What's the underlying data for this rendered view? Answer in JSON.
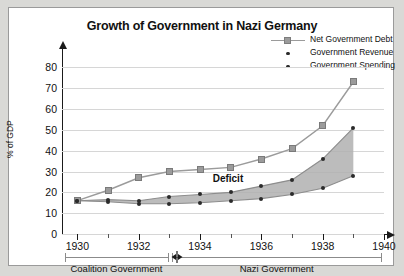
{
  "chart_data": {
    "type": "line",
    "title": "Growth of Government in Nazi Germany",
    "xlabel": "",
    "ylabel": "% of GDP",
    "xlim": [
      1929.5,
      1940
    ],
    "ylim": [
      0,
      85
    ],
    "yticks": [
      0,
      10,
      20,
      30,
      40,
      50,
      60,
      70,
      80
    ],
    "xticks": [
      1930,
      1932,
      1934,
      1936,
      1938,
      1940
    ],
    "x": [
      1930,
      1931,
      1932,
      1933,
      1934,
      1935,
      1936,
      1937,
      1938,
      1939
    ],
    "grid": true,
    "legend_position": "top-right",
    "series": [
      {
        "name": "Net Government Debt",
        "marker": "square",
        "color": "#9b9b9b",
        "values": [
          16,
          21,
          27,
          30,
          31,
          32,
          36,
          41,
          52,
          73
        ]
      },
      {
        "name": "Government Spending",
        "marker": "dot",
        "color": "#2b2b2b",
        "values": [
          16,
          16.5,
          16,
          18,
          19,
          20,
          23,
          26,
          36,
          51
        ]
      },
      {
        "name": "Government Revenue",
        "marker": "dot",
        "color": "#2b2b2b",
        "values": [
          16,
          15.5,
          14.5,
          14.5,
          15,
          16,
          17,
          19,
          22,
          28
        ]
      }
    ],
    "annotations": [
      {
        "text": "Deficit",
        "x": 1935.0,
        "y": 26
      }
    ],
    "period_brackets": [
      {
        "label": "Coalition Government",
        "start": 1929.6,
        "end": 1932.95
      },
      {
        "label": "Nazi Government",
        "start": 1933.1,
        "end": 1939.9
      }
    ]
  }
}
